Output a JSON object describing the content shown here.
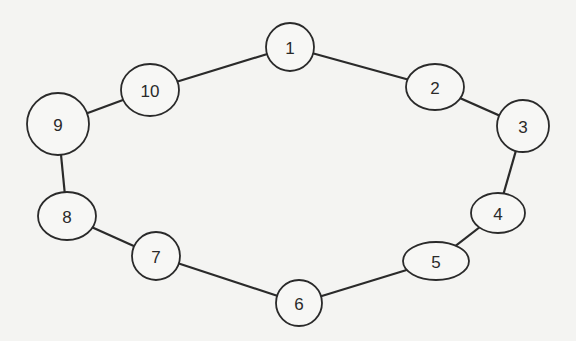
{
  "diagram": {
    "type": "ring-graph",
    "colors": {
      "stroke": "#2a2a2a",
      "node_fill": "#f7f7f5",
      "background": "#f4f4f2"
    },
    "nodes": [
      {
        "id": "1",
        "label": "1",
        "cx": 290,
        "cy": 47,
        "rx": 24,
        "ry": 24
      },
      {
        "id": "2",
        "label": "2",
        "cx": 435,
        "cy": 87,
        "rx": 29,
        "ry": 23
      },
      {
        "id": "3",
        "label": "3",
        "cx": 523,
        "cy": 126,
        "rx": 26,
        "ry": 26
      },
      {
        "id": "4",
        "label": "4",
        "cx": 498,
        "cy": 213,
        "rx": 27,
        "ry": 20
      },
      {
        "id": "5",
        "label": "5",
        "cx": 436,
        "cy": 261,
        "rx": 33,
        "ry": 19
      },
      {
        "id": "6",
        "label": "6",
        "cx": 299,
        "cy": 303,
        "rx": 23,
        "ry": 23
      },
      {
        "id": "7",
        "label": "7",
        "cx": 156,
        "cy": 256,
        "rx": 24,
        "ry": 24
      },
      {
        "id": "8",
        "label": "8",
        "cx": 67,
        "cy": 216,
        "rx": 29,
        "ry": 24
      },
      {
        "id": "9",
        "label": "9",
        "cx": 58,
        "cy": 124,
        "rx": 31,
        "ry": 31
      },
      {
        "id": "10",
        "label": "10",
        "cx": 150,
        "cy": 90,
        "rx": 29,
        "ry": 26
      }
    ],
    "edges": [
      {
        "from": "1",
        "to": "2"
      },
      {
        "from": "2",
        "to": "3"
      },
      {
        "from": "3",
        "to": "4"
      },
      {
        "from": "4",
        "to": "5"
      },
      {
        "from": "5",
        "to": "6"
      },
      {
        "from": "6",
        "to": "7"
      },
      {
        "from": "7",
        "to": "8"
      },
      {
        "from": "8",
        "to": "9"
      },
      {
        "from": "9",
        "to": "10"
      },
      {
        "from": "10",
        "to": "1"
      }
    ]
  }
}
